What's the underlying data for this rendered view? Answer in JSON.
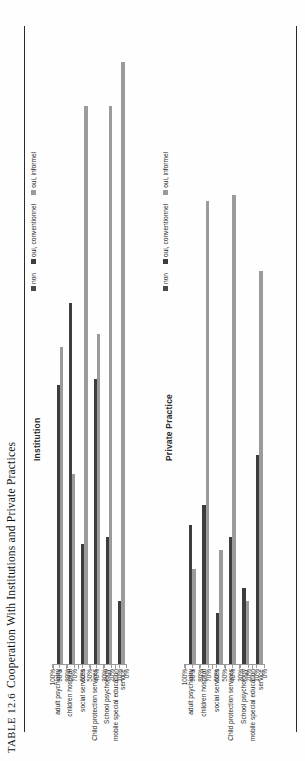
{
  "table": {
    "number": "TABLE 12.6",
    "caption": "Cooperation With Institutions and Private Practices",
    "full_title": "TABLE 12.6   Cooperation With Institutions and Private Practices"
  },
  "legend": {
    "items": [
      {
        "label": "non",
        "color": "#4a4a4a"
      },
      {
        "label": "oui, conventionnel",
        "color": "#3d3d3d"
      },
      {
        "label": "oui, informel",
        "color": "#9b9b9b"
      }
    ]
  },
  "axis": {
    "ticks": [
      "0%",
      "10%",
      "20%",
      "30%",
      "40%",
      "50%",
      "60%",
      "70%",
      "80%",
      "90%",
      "100%"
    ]
  },
  "chart_data": [
    {
      "type": "bar",
      "title": "Institution",
      "orientation": "horizontal",
      "categories": [
        "adult psychiatry",
        "children hospital",
        "social services",
        "Child protection services",
        "School psychology",
        "mobile special education service"
      ],
      "series": [
        {
          "name": "non",
          "color": "#4a4a4a",
          "values": [
            0,
            0,
            0,
            0,
            0,
            0
          ]
        },
        {
          "name": "oui, conventionnel",
          "color": "#3d3d3d",
          "values": [
            44,
            57,
            19,
            45,
            20,
            10
          ]
        },
        {
          "name": "oui, informel",
          "color": "#9b9b9b",
          "values": [
            50,
            30,
            88,
            52,
            88,
            95
          ]
        }
      ],
      "xlabel": "",
      "ylabel": "",
      "xlim": [
        0,
        100
      ],
      "grid": false,
      "legend_position": "top-right"
    },
    {
      "type": "bar",
      "title": "Private Practice",
      "orientation": "horizontal",
      "categories": [
        "adult psychiatry",
        "children hospital",
        "social services",
        "Child protection services",
        "School psychology",
        "mobile special education service"
      ],
      "series": [
        {
          "name": "non",
          "color": "#4a4a4a",
          "values": [
            0,
            0,
            0,
            0,
            0,
            0
          ]
        },
        {
          "name": "oui, conventionnel",
          "color": "#3d3d3d",
          "values": [
            22,
            25,
            8,
            20,
            12,
            33
          ]
        },
        {
          "name": "oui, informel",
          "color": "#9b9b9b",
          "values": [
            15,
            73,
            18,
            74,
            10,
            62
          ]
        }
      ],
      "xlabel": "",
      "ylabel": "",
      "xlim": [
        0,
        100
      ],
      "grid": false,
      "legend_position": "top-right"
    }
  ]
}
